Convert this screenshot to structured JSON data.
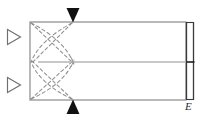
{
  "figure": {
    "kind": "optical-ray-diagram",
    "width": 205,
    "height": 122,
    "background_color": "#ffffff"
  },
  "colors": {
    "outline": "#8a8a8a",
    "outline_dark": "#3a3a3a",
    "axis": "#b4b4b4",
    "ray_dashed": "#8f8f8f",
    "arrow_filled": "#111111",
    "arrow_open_stroke": "#6f6f6f",
    "label": "#2b2b2b",
    "interior_fill": "#ffffff"
  },
  "body_rect": {
    "name": "main-body-rectangle",
    "x": 30,
    "y": 22,
    "width": 156,
    "height": 78,
    "fill": "#ffffff",
    "stroke": "#8a8a8a",
    "stroke_width": 1.2
  },
  "right_strip": {
    "name": "right-edge-strip",
    "x": 186,
    "y": 22,
    "width": 7,
    "height": 78,
    "stroke": "#3a3a3a",
    "tick_y": 62,
    "tick_label": ""
  },
  "optical_axis": {
    "name": "optical-axis-line",
    "x1": 38,
    "y1": 62,
    "x2": 186,
    "y2": 62,
    "stroke": "#b4b4b4",
    "stroke_width": 1.6
  },
  "focal_point": {
    "name": "focal-point",
    "x": 72,
    "y": 62
  },
  "rays": [
    {
      "name": "ray-upper-descending",
      "type": "line",
      "x1": 31,
      "y1": 23,
      "x2": 74,
      "y2": 64
    },
    {
      "name": "ray-lower-ascending",
      "type": "line",
      "x1": 31,
      "y1": 99,
      "x2": 74,
      "y2": 60
    },
    {
      "name": "ray-upper-crossing",
      "type": "line",
      "x1": 72,
      "y1": 23,
      "x2": 31,
      "y2": 64
    },
    {
      "name": "ray-lower-crossing",
      "type": "line",
      "x1": 72,
      "y1": 99,
      "x2": 31,
      "y2": 60
    },
    {
      "name": "ray-arc-upper",
      "type": "arc",
      "x1": 31,
      "y1": 23,
      "cx": 64,
      "cy": 40,
      "x2": 73,
      "y2": 62
    },
    {
      "name": "ray-arc-lower",
      "type": "arc",
      "x1": 31,
      "y1": 99,
      "cx": 64,
      "cy": 84,
      "x2": 73,
      "y2": 62
    },
    {
      "name": "ray-arc-upper-outer",
      "type": "arc",
      "x1": 72,
      "y1": 23,
      "cx": 40,
      "cy": 40,
      "x2": 31,
      "y2": 62
    },
    {
      "name": "ray-arc-lower-outer",
      "type": "arc",
      "x1": 72,
      "y1": 99,
      "cx": 40,
      "cy": 84,
      "x2": 31,
      "y2": 62
    }
  ],
  "arrows": {
    "filled": [
      {
        "name": "arrow-top-incoming",
        "x": 73,
        "y": 20,
        "direction": "down",
        "style": "filled",
        "size": 9
      },
      {
        "name": "arrow-bottom-incoming",
        "x": 73,
        "y": 102,
        "direction": "up",
        "style": "filled",
        "size": 9
      }
    ],
    "open": [
      {
        "name": "arrow-left-upper-output",
        "x": 14,
        "y": 37,
        "direction": "right",
        "style": "open",
        "size": 9
      },
      {
        "name": "arrow-left-lower-output",
        "x": 14,
        "y": 85,
        "direction": "right",
        "style": "open",
        "size": 9
      }
    ]
  },
  "labels": [
    {
      "name": "label-E",
      "text": "E",
      "x": 185,
      "y": 101,
      "style": "italic"
    }
  ]
}
